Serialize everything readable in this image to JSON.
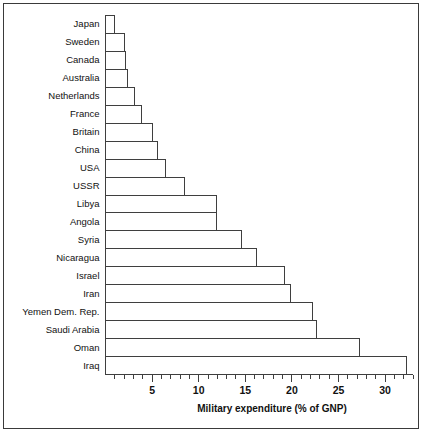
{
  "chart_data": {
    "type": "bar",
    "orientation": "horizontal",
    "title": "",
    "subtitle": "",
    "xlabel": "Military expenditure (% of GNP)",
    "ylabel": "",
    "xlim": [
      0,
      33
    ],
    "ylim": null,
    "grid": false,
    "legend": null,
    "legend_position": "none",
    "x_major_ticks": [
      5,
      10,
      15,
      20,
      25,
      30
    ],
    "x_tick_labels": [
      "5",
      "10",
      "15",
      "20",
      "25",
      "30"
    ],
    "x_minor_tick_step": 1,
    "categories": [
      "Japan",
      "Sweden",
      "Canada",
      "Australia",
      "Netherlands",
      "France",
      "Britain",
      "China",
      "USA",
      "USSR",
      "Libya",
      "Angola",
      "Syria",
      "Nicaragua",
      "Israel",
      "Iran",
      "Yemen Dem. Rep.",
      "Saudi Arabia",
      "Oman",
      "Iraq"
    ],
    "values": [
      1.0,
      2.0,
      2.1,
      2.4,
      3.1,
      3.9,
      5.0,
      5.6,
      6.4,
      8.5,
      11.9,
      11.9,
      14.6,
      16.2,
      19.2,
      19.9,
      22.2,
      22.6,
      27.3,
      32.3
    ],
    "colors": {
      "bar_fill": "#ffffff",
      "bar_stroke": "#3f3f3f",
      "axis": "#3f3f3f",
      "text": "#111111",
      "frame": "#3a3a3a",
      "background": "#ffffff"
    }
  },
  "figure": {
    "axis_title": "Military expenditure (% of GNP)",
    "frame_label": "chart-frame"
  }
}
